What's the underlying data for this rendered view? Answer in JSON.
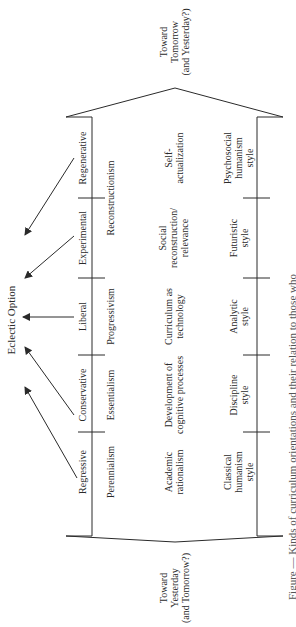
{
  "diagram": {
    "top_label": [
      "Toward",
      "Tomorrow",
      "(and Yesterday?)"
    ],
    "bottom_label": [
      "Toward",
      "Yesterday",
      "(and Tomorrow?)"
    ],
    "eclectic": "Eclectic Option",
    "orientations": [
      "Regressive",
      "Conservative",
      "Liberal",
      "Experimental",
      "Regenerative"
    ],
    "philosophies": [
      "Perennialism",
      "Essentialism",
      "Progressivism",
      "Reconstructionism"
    ],
    "conceptions": [
      [
        "Academic",
        "rationalism"
      ],
      [
        "Development of",
        "cognitive processes"
      ],
      [
        "Curriculum as",
        "technology"
      ],
      [
        "Social",
        "reconstruction/",
        "relevance"
      ],
      [
        "Self-",
        "actualization"
      ]
    ],
    "styles": [
      [
        "Classical",
        "humanism",
        "style"
      ],
      [
        "Discipline",
        "style"
      ],
      [
        "Analytic",
        "style"
      ],
      [
        "Futuristic",
        "style"
      ],
      [
        "Psychosocial",
        "humanism",
        "style"
      ]
    ],
    "caption_fragment": "Figure — Kinds of curriculum orientations and their relation to those who"
  },
  "colors": {
    "ink": "#2a2a2a",
    "background": "#ffffff"
  }
}
